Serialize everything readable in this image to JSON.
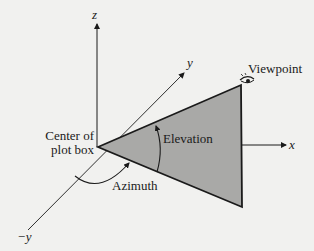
{
  "diagram": {
    "labels": {
      "z_axis": "z",
      "y_axis": "y",
      "neg_y_axis": "−y",
      "x_axis": "x",
      "viewpoint": "Viewpoint",
      "center_line1": "Center of",
      "center_line2": "plot box",
      "elevation": "Elevation",
      "azimuth": "Azimuth"
    },
    "colors": {
      "background": "#f1f1ef",
      "line": "#1a1a1a",
      "triangle_fill": "#a9a9a7"
    }
  }
}
